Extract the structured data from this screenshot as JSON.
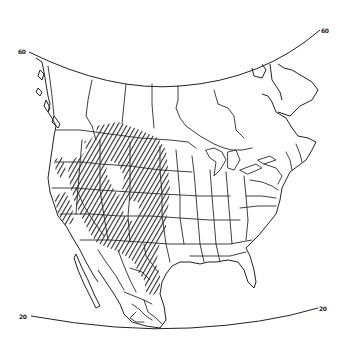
{
  "map": {
    "title": "",
    "region": "North America",
    "projection": "conic (latitude arcs shown)",
    "latitude_lines": [
      {
        "value": "60",
        "left_label": "60",
        "right_label": "60"
      },
      {
        "value": "20",
        "left_label": "20",
        "right_label": "20"
      }
    ],
    "boundaries": [
      "US states",
      "Canadian provinces",
      "Mexican states"
    ],
    "shaded_region": {
      "pattern": "diagonal hatching",
      "description": "Great Plains and western interior of North America, from southern Alberta/Saskatchewan/Manitoba south through Montana, Dakotas, Wyoming, Colorado, Nebraska, Kansas, Utah, Nevada, Arizona, New Mexico, Texas into northern Mexico; also eastern Oregon/Washington and California Central Valley"
    },
    "colors": {
      "background": "#ffffff",
      "lines": "#2a2a2a",
      "hatching": "#333333"
    }
  }
}
